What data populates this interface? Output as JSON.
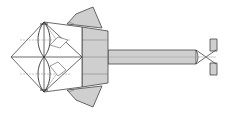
{
  "diagram": {
    "type": "origami-fold-diagram",
    "colors": {
      "paper_front": "#ffffff",
      "paper_back": "#cfcfcf",
      "line": "#444444",
      "crease": "#888888"
    },
    "parts": [
      {
        "name": "head-diamond",
        "fill": "paper_front"
      },
      {
        "name": "upper-flap",
        "fill": "paper_back"
      },
      {
        "name": "lower-flap",
        "fill": "paper_back"
      },
      {
        "name": "body-panel",
        "fill": "paper_back"
      },
      {
        "name": "stem",
        "fill": "paper_back"
      },
      {
        "name": "tail",
        "fill": "paper_back"
      }
    ]
  }
}
